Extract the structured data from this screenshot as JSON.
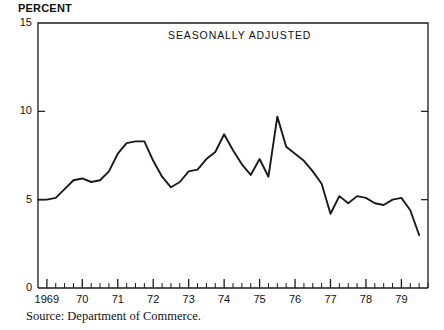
{
  "figure": {
    "unit_label": "PERCENT",
    "source_note": "Source: Department of Commerce.",
    "ink_color": "#1a1a1a",
    "background_color": "#ffffff"
  },
  "chart_data": {
    "type": "line",
    "title": "SEASONALLY ADJUSTED",
    "xlabel": "",
    "ylabel": "PERCENT",
    "ylim": [
      0,
      15
    ],
    "xlim": [
      1968.75,
      1979.75
    ],
    "grid": false,
    "legend": null,
    "yticks": [
      0,
      5,
      10,
      15
    ],
    "ytick_labels": [
      "0",
      "5",
      "10",
      "15"
    ],
    "xticks": [
      1969,
      1970,
      1971,
      1972,
      1973,
      1974,
      1975,
      1976,
      1977,
      1978,
      1979
    ],
    "xtick_labels": [
      "1969",
      "70",
      "71",
      "72",
      "73",
      "74",
      "75",
      "76",
      "77",
      "78",
      "79"
    ],
    "minor_xticks_per_year": 4,
    "series": [
      {
        "name": "Percent",
        "x": [
          1968.75,
          1969.0,
          1969.25,
          1969.5,
          1969.75,
          1970.0,
          1970.25,
          1970.5,
          1970.75,
          1971.0,
          1971.25,
          1971.5,
          1971.75,
          1972.0,
          1972.25,
          1972.5,
          1972.75,
          1973.0,
          1973.25,
          1973.5,
          1973.75,
          1974.0,
          1974.25,
          1974.5,
          1974.75,
          1975.0,
          1975.25,
          1975.5,
          1975.75,
          1976.0,
          1976.25,
          1976.5,
          1976.75,
          1977.0,
          1977.25,
          1977.5,
          1977.75,
          1978.0,
          1978.25,
          1978.5,
          1978.75,
          1979.0,
          1979.25,
          1979.5
        ],
        "y": [
          5.0,
          5.0,
          5.1,
          5.6,
          6.1,
          6.2,
          6.0,
          6.1,
          6.6,
          7.6,
          8.2,
          8.3,
          8.3,
          7.2,
          6.3,
          5.7,
          6.0,
          6.6,
          6.7,
          7.3,
          7.7,
          8.7,
          7.8,
          7.0,
          6.4,
          7.3,
          6.3,
          9.7,
          8.0,
          7.6,
          7.2,
          6.6,
          5.9,
          4.2,
          5.2,
          4.8,
          5.2,
          5.1,
          4.8,
          4.7,
          5.0,
          5.1,
          4.4,
          3.0
        ]
      }
    ],
    "annotations": [
      {
        "text": "SEASONALLY ADJUSTED",
        "position": "top-center-right"
      }
    ],
    "max_value": 9.7,
    "max_value_x": 1975.5,
    "min_value": 3.0,
    "min_value_x": 1979.5,
    "start_value": 5.0,
    "end_value": 3.0
  },
  "plot_box": {
    "left": 38,
    "top": 23,
    "right": 428,
    "bottom": 288
  }
}
